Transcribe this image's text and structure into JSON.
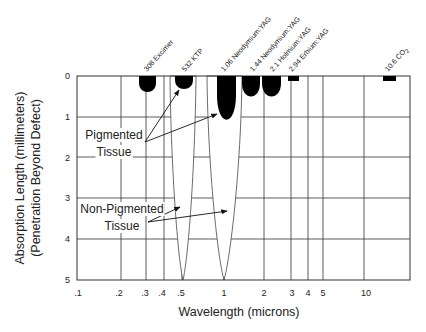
{
  "chart_data": {
    "type": "other",
    "title": "",
    "xlabel": "Wavelength (microns)",
    "ylabel_line1": "Absorption Length (millimeters)",
    "ylabel_line2": "(Penetration Beyond Defect)",
    "x_scale": "log",
    "xlim": [
      0.1,
      20
    ],
    "ylim": [
      0,
      5
    ],
    "y_inverted": true,
    "grid": true,
    "x_ticks": [
      {
        "label": ".1",
        "value": 0.1
      },
      {
        "label": ".2",
        "value": 0.2
      },
      {
        "label": ".3",
        "value": 0.3
      },
      {
        "label": ".4",
        "value": 0.4
      },
      {
        "label": ".5",
        "value": 0.5
      },
      {
        "label": "1",
        "value": 1
      },
      {
        "label": "2",
        "value": 2
      },
      {
        "label": "3",
        "value": 3
      },
      {
        "label": "4",
        "value": 4
      },
      {
        "label": "5",
        "value": 5
      },
      {
        "label": "10",
        "value": 10
      }
    ],
    "y_ticks": [
      "0",
      "1",
      "2",
      "3",
      "4",
      "5"
    ],
    "lasers": [
      {
        "label": "308  Excimer",
        "wavelength_um": 0.308,
        "pigmented_depth_mm": 0.4
      },
      {
        "label": "532  KTP",
        "wavelength_um": 0.532,
        "pigmented_depth_mm": 0.35,
        "non_pigmented_depth_mm": 5
      },
      {
        "label": "1.06  Neodymium:YAG",
        "wavelength_um": 1.06,
        "pigmented_depth_mm": 1.0,
        "non_pigmented_depth_mm": 5
      },
      {
        "label": "1.44  Neodymium:YAG",
        "wavelength_um": 1.44,
        "pigmented_depth_mm": 0.45
      },
      {
        "label": "2.1  Holmium:YAG",
        "wavelength_um": 2.1,
        "pigmented_depth_mm": 0.45
      },
      {
        "label": "2.94  Erbium:YAG",
        "wavelength_um": 2.94,
        "pigmented_depth_mm": 0.05
      },
      {
        "label": "10.6  CO",
        "label_sub": "2",
        "wavelength_um": 10.6,
        "pigmented_depth_mm": 0.05
      }
    ],
    "annotations": [
      {
        "line1": "Pigmented",
        "line2": "Tissue"
      },
      {
        "line1": "Non-Pigmented",
        "line2": "Tissue"
      }
    ]
  }
}
